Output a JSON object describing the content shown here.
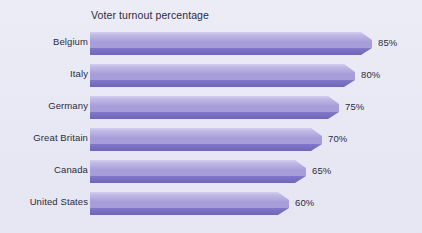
{
  "chart_data": {
    "type": "bar",
    "orientation": "horizontal",
    "title": "Voter turnout percentage",
    "xlabel": "",
    "ylabel": "",
    "categories": [
      "Belgium",
      "Italy",
      "Germany",
      "Great Britain",
      "Canada",
      "United States"
    ],
    "values": [
      85,
      80,
      75,
      70,
      65,
      60
    ],
    "value_labels": [
      "85%",
      "80%",
      "75%",
      "70%",
      "65%",
      "60%"
    ],
    "xlim": [
      0,
      100
    ],
    "grid": false,
    "legend": null,
    "style": "3d-beveled-bars",
    "colors": {
      "background": "#e9e9f5",
      "bar_top": "#c0bae6",
      "bar_mid": "#a79ed9",
      "bar_bottom": "#8078c8",
      "bar_edge_dark": "#6f66bb",
      "bar_highlight": "#d3cef0",
      "text": "#2b2b3c"
    }
  },
  "chart": {
    "title": "Voter turnout percentage",
    "rows": [
      {
        "category": "Belgium",
        "value": 85,
        "label": "85%"
      },
      {
        "category": "Italy",
        "value": 80,
        "label": "80%"
      },
      {
        "category": "Germany",
        "value": 75,
        "label": "75%"
      },
      {
        "category": "Great Britain",
        "value": 70,
        "label": "70%"
      },
      {
        "category": "Canada",
        "value": 65,
        "label": "65%"
      },
      {
        "category": "United States",
        "value": 60,
        "label": "60%"
      }
    ]
  }
}
